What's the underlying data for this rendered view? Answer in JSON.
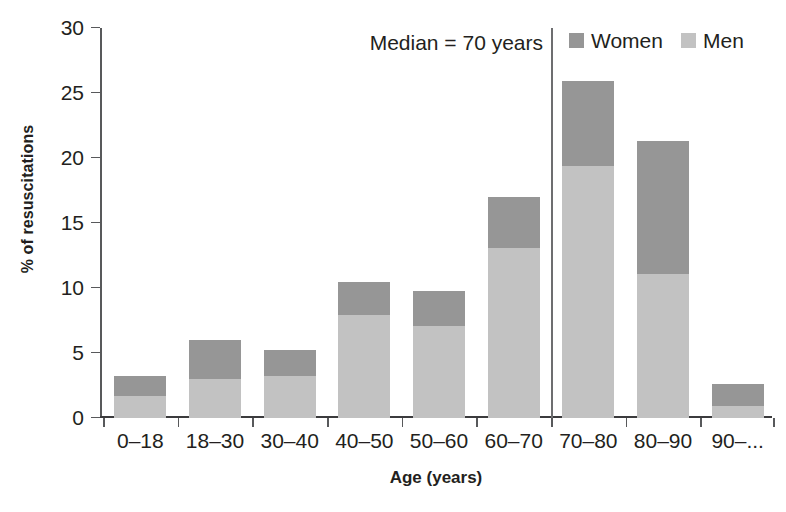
{
  "chart_data": {
    "type": "bar",
    "subtype": "stacked-bar",
    "title": "",
    "xlabel": "Age (years)",
    "ylabel": "% of resuscitations",
    "categories": [
      "0–18",
      "18–30",
      "30–40",
      "40–50",
      "50–60",
      "60–70",
      "70–80",
      "80–90",
      "90–..."
    ],
    "series": [
      {
        "name": "Men",
        "color": "#c2c2c2",
        "values": [
          1.7,
          3.0,
          3.2,
          7.9,
          7.1,
          13.1,
          19.4,
          11.1,
          0.9
        ]
      },
      {
        "name": "Women",
        "color": "#969696",
        "values": [
          1.5,
          3.0,
          2.0,
          2.6,
          2.7,
          3.9,
          6.5,
          10.2,
          1.7
        ]
      }
    ],
    "stack_totals": [
      3.2,
      6.0,
      5.2,
      10.5,
      9.8,
      17.0,
      25.9,
      21.3,
      2.6
    ],
    "ylim": [
      0,
      30
    ],
    "yticks": [
      0,
      5,
      10,
      15,
      20,
      25,
      30
    ],
    "ytick_labels": [
      "0",
      "5",
      "10",
      "15",
      "20",
      "25",
      "30"
    ],
    "grid": false,
    "legend_position": "top-right",
    "annotations": [
      {
        "name": "median-marker",
        "text": "Median = 70 years",
        "value": 70,
        "between_categories": [
          "60–70",
          "70–80"
        ]
      }
    ]
  },
  "axes": {
    "y_title": "% of resuscitations",
    "x_title": "Age (years)"
  },
  "legend": {
    "items": [
      {
        "label": "Women",
        "color": "#969696"
      },
      {
        "label": "Men",
        "color": "#c2c2c2"
      }
    ]
  },
  "annotation": {
    "median_text": "Median = 70 years"
  },
  "colors": {
    "women": "#969696",
    "men": "#c2c2c2",
    "axis": "#58595b",
    "text": "#231f20",
    "background": "#ffffff"
  }
}
